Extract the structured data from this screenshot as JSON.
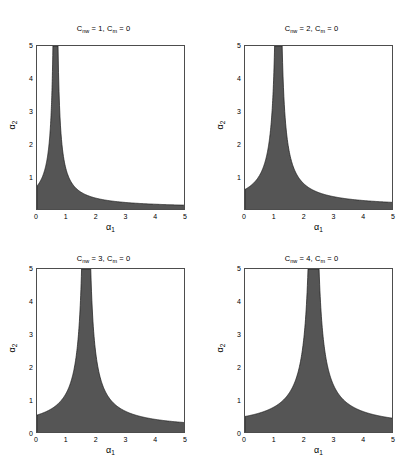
{
  "figure": {
    "background": "#ffffff",
    "fill_color": "#555555",
    "axis_color": "#4d4d4d",
    "width": 415,
    "height": 476
  },
  "axis_labels": {
    "x": "α",
    "x_sub": "1",
    "y": "α",
    "y_sub": "2"
  },
  "chart_data": [
    {
      "type": "area",
      "title": "C_nw = 1, C_m = 0",
      "title_parts": {
        "c1_base": "C",
        "c1_sub": "nw",
        "c1_value": "1",
        "c2_base": "C",
        "c2_sub": "m",
        "c2_value": "0"
      },
      "xlabel": "α1",
      "ylabel": "α2",
      "xlim": [
        0,
        5
      ],
      "ylim": [
        0,
        5
      ],
      "xticks": [
        0,
        1,
        2,
        3,
        4,
        5
      ],
      "yticks": [
        1,
        2,
        3,
        4,
        5
      ],
      "xtick_labels": [
        "0",
        "1",
        "2",
        "3",
        "4",
        "5"
      ],
      "ytick_labels": [
        "1",
        "2",
        "3",
        "4",
        "5"
      ],
      "grid": false,
      "legend": "none",
      "region_description": "Shaded region below hyperbolic boundary (α1-a)(α2-b)=k, vertical asymptote near α1=0.62",
      "boundary": {
        "vertical_asymptote": 0.62,
        "horizontal_asymptote": 0.08,
        "curvature_constant": 0.42
      },
      "boundary_points": [
        [
          0.0,
          1.62
        ],
        [
          0.1,
          1.22
        ],
        [
          0.2,
          0.93
        ],
        [
          0.3,
          0.72
        ],
        [
          0.5,
          0.45
        ],
        [
          0.7,
          0.31
        ],
        [
          1.0,
          0.21
        ],
        [
          1.5,
          0.14
        ],
        [
          2.0,
          0.12
        ],
        [
          3.0,
          0.1
        ],
        [
          4.0,
          0.09
        ],
        [
          5.0,
          0.085
        ]
      ]
    },
    {
      "type": "area",
      "title": "C_nw = 2, C_m = 0",
      "title_parts": {
        "c1_base": "C",
        "c1_sub": "nw",
        "c1_value": "2",
        "c2_base": "C",
        "c2_sub": "m",
        "c2_value": "0"
      },
      "xlabel": "α1",
      "ylabel": "α2",
      "xlim": [
        0,
        5
      ],
      "ylim": [
        0,
        5
      ],
      "xticks": [
        0,
        1,
        2,
        3,
        4,
        5
      ],
      "yticks": [
        1,
        2,
        3,
        4,
        5
      ],
      "xtick_labels": [
        "0",
        "1",
        "2",
        "3",
        "4",
        "5"
      ],
      "ytick_labels": [
        "1",
        "2",
        "3",
        "4",
        "5"
      ],
      "grid": false,
      "legend": "none",
      "region_description": "Shaded hyperbolic region, vertical asymptote near α1=1.12",
      "boundary": {
        "vertical_asymptote": 1.12,
        "horizontal_asymptote": 0.1,
        "curvature_constant": 0.62
      },
      "boundary_points": [
        [
          0.0,
          0.82
        ],
        [
          0.3,
          0.72
        ],
        [
          0.6,
          0.62
        ],
        [
          0.9,
          0.48
        ],
        [
          1.2,
          0.42
        ],
        [
          1.6,
          0.3
        ],
        [
          2.0,
          0.24
        ],
        [
          2.5,
          0.2
        ],
        [
          3.0,
          0.18
        ],
        [
          4.0,
          0.15
        ],
        [
          5.0,
          0.13
        ]
      ]
    },
    {
      "type": "area",
      "title": "C_nw = 3, C_m = 0",
      "title_parts": {
        "c1_base": "C",
        "c1_sub": "nw",
        "c1_value": "3",
        "c2_base": "C",
        "c2_sub": "m",
        "c2_value": "0"
      },
      "xlabel": "α1",
      "ylabel": "α2",
      "xlim": [
        0,
        5
      ],
      "ylim": [
        0,
        5
      ],
      "xticks": [
        0,
        1,
        2,
        3,
        4,
        5
      ],
      "yticks": [
        0,
        1,
        2,
        3,
        4,
        5
      ],
      "xtick_labels": [
        "0",
        "1",
        "2",
        "3",
        "4",
        "5"
      ],
      "ytick_labels": [
        "0",
        "1",
        "2",
        "3",
        "4",
        "5"
      ],
      "grid": false,
      "legend": "none",
      "region_description": "Shaded hyperbolic region, vertical asymptote near α1=1.65",
      "boundary": {
        "vertical_asymptote": 1.65,
        "horizontal_asymptote": 0.12,
        "curvature_constant": 0.75
      },
      "boundary_points": [
        [
          0.0,
          0.58
        ],
        [
          0.4,
          0.55
        ],
        [
          0.8,
          0.52
        ],
        [
          1.2,
          0.48
        ],
        [
          1.7,
          0.42
        ],
        [
          2.2,
          0.33
        ],
        [
          2.8,
          0.26
        ],
        [
          3.4,
          0.22
        ],
        [
          4.0,
          0.19
        ],
        [
          4.5,
          0.17
        ],
        [
          5.0,
          0.16
        ]
      ]
    },
    {
      "type": "area",
      "title": "C_nw = 4, C_m = 0",
      "title_parts": {
        "c1_base": "C",
        "c1_sub": "nw",
        "c1_value": "4",
        "c2_base": "C",
        "c2_sub": "m",
        "c2_value": "0"
      },
      "xlabel": "α1",
      "ylabel": "α2",
      "xlim": [
        0,
        5
      ],
      "ylim": [
        0,
        5
      ],
      "xticks": [
        0,
        1,
        2,
        3,
        4,
        5
      ],
      "yticks": [
        0,
        1,
        2,
        3,
        4,
        5
      ],
      "xtick_labels": [
        "0",
        "1",
        "2",
        "3",
        "4",
        "5"
      ],
      "ytick_labels": [
        "0",
        "1",
        "2",
        "3",
        "4",
        "5"
      ],
      "grid": false,
      "legend": "none",
      "region_description": "Shaded hyperbolic region, vertical asymptote near α1=2.30",
      "boundary": {
        "vertical_asymptote": 2.3,
        "horizontal_asymptote": 0.14,
        "curvature_constant": 0.9
      },
      "boundary_points": [
        [
          0.0,
          0.42
        ],
        [
          0.5,
          0.42
        ],
        [
          1.0,
          0.4
        ],
        [
          1.5,
          0.38
        ],
        [
          2.0,
          0.34
        ],
        [
          2.6,
          0.3
        ],
        [
          3.2,
          0.25
        ],
        [
          3.8,
          0.22
        ],
        [
          4.4,
          0.19
        ],
        [
          5.0,
          0.17
        ]
      ]
    }
  ]
}
